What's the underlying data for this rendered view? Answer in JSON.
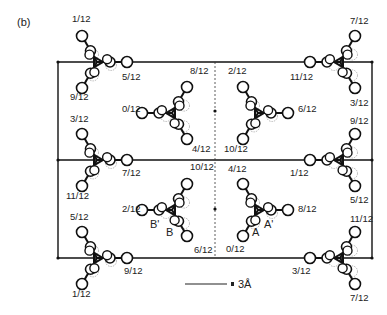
{
  "panel_label": "(b)",
  "scale_bar": {
    "label": "3Å"
  },
  "molecules": [
    {
      "id": "m1",
      "cx": 97,
      "cy": 62,
      "orient": "right",
      "labels": [
        {
          "t": "1/12",
          "x": 72,
          "y": 22
        },
        {
          "t": "5/12",
          "x": 122,
          "y": 80
        },
        {
          "t": "9/12",
          "x": 70,
          "y": 100
        }
      ]
    },
    {
      "id": "m2",
      "cx": 340,
      "cy": 62,
      "orient": "left",
      "labels": [
        {
          "t": "7/12",
          "x": 350,
          "y": 24
        },
        {
          "t": "11/12",
          "x": 290,
          "y": 80
        },
        {
          "t": "3/12",
          "x": 350,
          "y": 106
        }
      ]
    },
    {
      "id": "m3",
      "cx": 172,
      "cy": 113,
      "orient": "left",
      "labels": [
        {
          "t": "8/12",
          "x": 190,
          "y": 74
        },
        {
          "t": "0/12",
          "x": 122,
          "y": 112
        },
        {
          "t": "4/12",
          "x": 192,
          "y": 152
        }
      ]
    },
    {
      "id": "m4",
      "cx": 258,
      "cy": 113,
      "orient": "right",
      "labels": [
        {
          "t": "2/12",
          "x": 228,
          "y": 74
        },
        {
          "t": "6/12",
          "x": 298,
          "y": 112
        },
        {
          "t": "10/12",
          "x": 224,
          "y": 152
        }
      ]
    },
    {
      "id": "m5",
      "cx": 97,
      "cy": 160,
      "orient": "right",
      "labels": [
        {
          "t": "3/12",
          "x": 70,
          "y": 122
        },
        {
          "t": "7/12",
          "x": 122,
          "y": 176
        },
        {
          "t": "11/12",
          "x": 66,
          "y": 199
        }
      ]
    },
    {
      "id": "m6",
      "cx": 340,
      "cy": 160,
      "orient": "left",
      "labels": [
        {
          "t": "9/12",
          "x": 350,
          "y": 124
        },
        {
          "t": "1/12",
          "x": 290,
          "y": 176
        },
        {
          "t": "5/12",
          "x": 350,
          "y": 203
        }
      ]
    },
    {
      "id": "m7",
      "cx": 172,
      "cy": 210,
      "orient": "left",
      "labels": [
        {
          "t": "10/12",
          "x": 190,
          "y": 170
        },
        {
          "t": "2/12",
          "x": 122,
          "y": 212
        },
        {
          "t": "6/12",
          "x": 194,
          "y": 253
        }
      ]
    },
    {
      "id": "m8",
      "cx": 258,
      "cy": 210,
      "orient": "right",
      "labels": [
        {
          "t": "4/12",
          "x": 228,
          "y": 172
        },
        {
          "t": "8/12",
          "x": 298,
          "y": 212
        },
        {
          "t": "0/12",
          "x": 226,
          "y": 252
        }
      ]
    },
    {
      "id": "m9",
      "cx": 97,
      "cy": 258,
      "orient": "right",
      "labels": [
        {
          "t": "5/12",
          "x": 70,
          "y": 220
        },
        {
          "t": "9/12",
          "x": 124,
          "y": 274
        },
        {
          "t": "1/12",
          "x": 72,
          "y": 297
        }
      ]
    },
    {
      "id": "m10",
      "cx": 340,
      "cy": 258,
      "orient": "left",
      "labels": [
        {
          "t": "11/12",
          "x": 350,
          "y": 222
        },
        {
          "t": "3/12",
          "x": 292,
          "y": 274
        },
        {
          "t": "7/12",
          "x": 350,
          "y": 301
        }
      ]
    }
  ],
  "site_labels": [
    {
      "t": "B'",
      "x": 150,
      "y": 228
    },
    {
      "t": "B",
      "x": 166,
      "y": 236
    },
    {
      "t": "A",
      "x": 252,
      "y": 236
    },
    {
      "t": "A'",
      "x": 264,
      "y": 228
    }
  ]
}
